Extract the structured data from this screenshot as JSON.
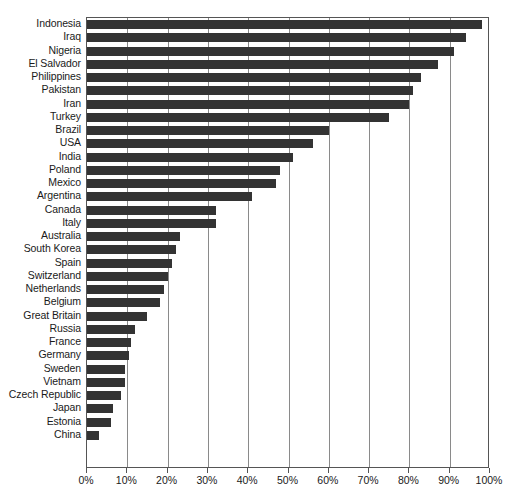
{
  "chart_data": {
    "type": "bar",
    "orientation": "horizontal",
    "title": "",
    "xlabel": "",
    "ylabel": "",
    "xlim": [
      0,
      100
    ],
    "xtick_labels": [
      "0%",
      "10%",
      "20%",
      "30%",
      "40%",
      "50%",
      "60%",
      "70%",
      "80%",
      "90%",
      "100%"
    ],
    "xticks": [
      0,
      10,
      20,
      30,
      40,
      50,
      60,
      70,
      80,
      90,
      100
    ],
    "grid": "vertical",
    "legend": "none",
    "bar_color": "#333333",
    "gridline_color": "#8a8a8a",
    "axis_color": "#555555",
    "categories": [
      "Indonesia",
      "Iraq",
      "Nigeria",
      "El Salvador",
      "Philippines",
      "Pakistan",
      "Iran",
      "Turkey",
      "Brazil",
      "USA",
      "India",
      "Poland",
      "Mexico",
      "Argentina",
      "Canada",
      "Italy",
      "Australia",
      "South Korea",
      "Spain",
      "Switzerland",
      "Netherlands",
      "Belgium",
      "Great Britain",
      "Russia",
      "France",
      "Germany",
      "Sweden",
      "Vietnam",
      "Czech Republic",
      "Japan",
      "Estonia",
      "China"
    ],
    "values": [
      98,
      94,
      91,
      87,
      83,
      81,
      80,
      75,
      60,
      56,
      51,
      48,
      47,
      41,
      32,
      32,
      23,
      22,
      21,
      20,
      19,
      18,
      15,
      12,
      11,
      10.5,
      9.5,
      9.5,
      8.5,
      6.5,
      6,
      3
    ]
  }
}
